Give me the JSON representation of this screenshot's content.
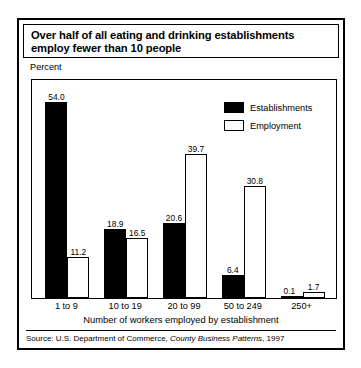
{
  "title": "Over half of all eating and drinking establishments employ fewer than 10 people",
  "axis": {
    "y_label": "Percent",
    "x_label": "Number of workers employed by establishment"
  },
  "legend": {
    "items": [
      {
        "label": "Establishments",
        "swatch": "filled",
        "color": "#000000"
      },
      {
        "label": "Employment",
        "swatch": "hollow",
        "color": "#ffffff"
      }
    ]
  },
  "source": {
    "prefix": "Source: U.S. Department of Commerce, ",
    "italic": "County Business Patterns",
    "suffix": ", 1997"
  },
  "chart_data": {
    "type": "bar",
    "title": "Over half of all eating and drinking establishments employ fewer than 10 people",
    "xlabel": "Number of workers employed by establishment",
    "ylabel": "Percent",
    "ylim": [
      0,
      60
    ],
    "grid": false,
    "legend_position": "top-right",
    "categories": [
      "1 to 9",
      "10 to 19",
      "20 to 99",
      "50 to 249",
      "250+"
    ],
    "series": [
      {
        "name": "Establishments",
        "color": "#000000",
        "values": [
          54.0,
          18.9,
          20.6,
          6.4,
          0.1
        ],
        "labels": [
          "54.0",
          "18.9",
          "20.6",
          "6.4",
          "0.1"
        ]
      },
      {
        "name": "Employment",
        "color": "#ffffff",
        "values": [
          11.2,
          16.5,
          39.7,
          30.8,
          1.7
        ],
        "labels": [
          "11.2",
          "16.5",
          "39.7",
          "30.8",
          "1.7"
        ]
      }
    ]
  }
}
